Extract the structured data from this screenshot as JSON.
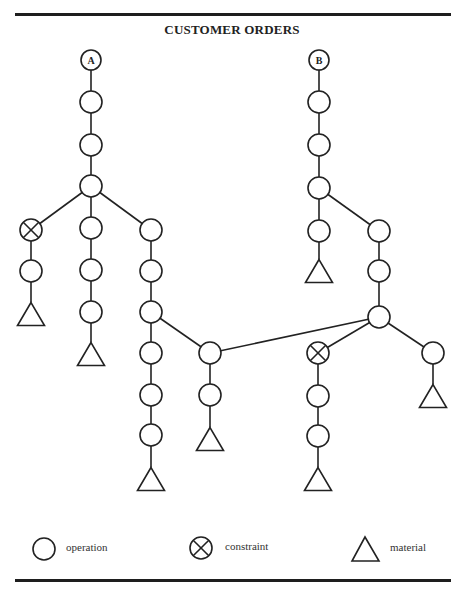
{
  "title": "CUSTOMER ORDERS",
  "colors": {
    "stroke": "#222222",
    "background": "#ffffff"
  },
  "roots": [
    {
      "id": "A",
      "label": "A"
    },
    {
      "id": "B",
      "label": "B"
    }
  ],
  "legend": {
    "operation": {
      "label": "operation",
      "icon": "circle-icon"
    },
    "constraint": {
      "label": "constraint",
      "icon": "circle-x-icon"
    },
    "material": {
      "label": "material",
      "icon": "triangle-icon"
    }
  },
  "nodes": [
    {
      "id": "A",
      "type": "root",
      "label": "A",
      "x": 91,
      "y": 60
    },
    {
      "id": "a1",
      "type": "operation",
      "x": 91,
      "y": 102
    },
    {
      "id": "a2",
      "type": "operation",
      "x": 91,
      "y": 145
    },
    {
      "id": "a3",
      "type": "operation",
      "x": 91,
      "y": 186
    },
    {
      "id": "aL1",
      "type": "constraint",
      "x": 31,
      "y": 230
    },
    {
      "id": "aL2",
      "type": "operation",
      "x": 31,
      "y": 271
    },
    {
      "id": "aL3",
      "type": "material",
      "x": 31,
      "y": 314
    },
    {
      "id": "aM1",
      "type": "operation",
      "x": 91,
      "y": 228
    },
    {
      "id": "aM2",
      "type": "operation",
      "x": 91,
      "y": 270
    },
    {
      "id": "aM3",
      "type": "operation",
      "x": 91,
      "y": 312
    },
    {
      "id": "aM4",
      "type": "material",
      "x": 91,
      "y": 354
    },
    {
      "id": "aR1",
      "type": "operation",
      "x": 151,
      "y": 230
    },
    {
      "id": "aR2",
      "type": "operation",
      "x": 151,
      "y": 271
    },
    {
      "id": "aR3",
      "type": "operation",
      "x": 151,
      "y": 312
    },
    {
      "id": "aR4",
      "type": "operation",
      "x": 151,
      "y": 353
    },
    {
      "id": "aR5",
      "type": "operation",
      "x": 151,
      "y": 395
    },
    {
      "id": "aR6",
      "type": "operation",
      "x": 151,
      "y": 435
    },
    {
      "id": "aR7",
      "type": "material",
      "x": 151,
      "y": 479
    },
    {
      "id": "m1",
      "type": "operation",
      "x": 210,
      "y": 353
    },
    {
      "id": "m2",
      "type": "operation",
      "x": 210,
      "y": 395
    },
    {
      "id": "m3",
      "type": "material",
      "x": 210,
      "y": 439
    },
    {
      "id": "B",
      "type": "root",
      "label": "B",
      "x": 319,
      "y": 60
    },
    {
      "id": "b1",
      "type": "operation",
      "x": 319,
      "y": 102
    },
    {
      "id": "b2",
      "type": "operation",
      "x": 319,
      "y": 145
    },
    {
      "id": "b3",
      "type": "operation",
      "x": 319,
      "y": 188
    },
    {
      "id": "bL1",
      "type": "operation",
      "x": 319,
      "y": 231
    },
    {
      "id": "bL2",
      "type": "material",
      "x": 319,
      "y": 271
    },
    {
      "id": "bR1",
      "type": "operation",
      "x": 379,
      "y": 231
    },
    {
      "id": "bR2",
      "type": "operation",
      "x": 379,
      "y": 271
    },
    {
      "id": "bR3",
      "type": "operation",
      "x": 379,
      "y": 317
    },
    {
      "id": "bC1",
      "type": "constraint",
      "x": 318,
      "y": 353
    },
    {
      "id": "bC2",
      "type": "operation",
      "x": 318,
      "y": 396
    },
    {
      "id": "bC3",
      "type": "operation",
      "x": 318,
      "y": 436
    },
    {
      "id": "bC4",
      "type": "material",
      "x": 318,
      "y": 479
    },
    {
      "id": "bF1",
      "type": "operation",
      "x": 433,
      "y": 353
    },
    {
      "id": "bF2",
      "type": "material",
      "x": 433,
      "y": 396
    }
  ],
  "edges": [
    [
      "A",
      "a1"
    ],
    [
      "a1",
      "a2"
    ],
    [
      "a2",
      "a3"
    ],
    [
      "a3",
      "aL1"
    ],
    [
      "aL1",
      "aL2"
    ],
    [
      "aL2",
      "aL3"
    ],
    [
      "a3",
      "aM1"
    ],
    [
      "aM1",
      "aM2"
    ],
    [
      "aM2",
      "aM3"
    ],
    [
      "aM3",
      "aM4"
    ],
    [
      "a3",
      "aR1"
    ],
    [
      "aR1",
      "aR2"
    ],
    [
      "aR2",
      "aR3"
    ],
    [
      "aR3",
      "aR4"
    ],
    [
      "aR4",
      "aR5"
    ],
    [
      "aR5",
      "aR6"
    ],
    [
      "aR6",
      "aR7"
    ],
    [
      "aR3",
      "m1"
    ],
    [
      "m1",
      "m2"
    ],
    [
      "m2",
      "m3"
    ],
    [
      "bR3",
      "m1"
    ],
    [
      "B",
      "b1"
    ],
    [
      "b1",
      "b2"
    ],
    [
      "b2",
      "b3"
    ],
    [
      "b3",
      "bL1"
    ],
    [
      "bL1",
      "bL2"
    ],
    [
      "b3",
      "bR1"
    ],
    [
      "bR1",
      "bR2"
    ],
    [
      "bR2",
      "bR3"
    ],
    [
      "bR3",
      "bC1"
    ],
    [
      "bC1",
      "bC2"
    ],
    [
      "bC2",
      "bC3"
    ],
    [
      "bC3",
      "bC4"
    ],
    [
      "bR3",
      "bF1"
    ],
    [
      "bF1",
      "bF2"
    ]
  ]
}
